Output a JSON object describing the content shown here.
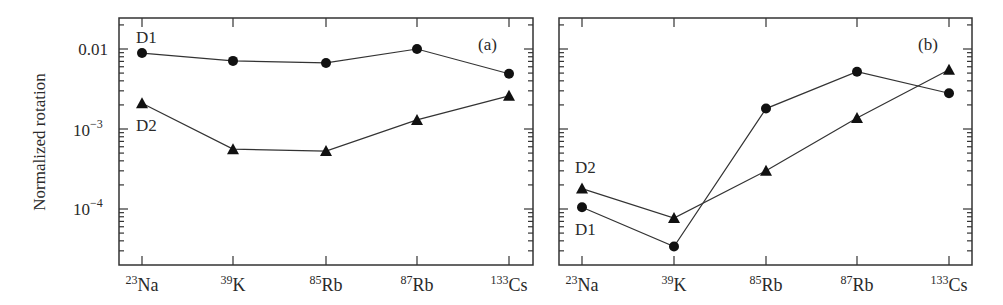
{
  "figure": {
    "ylabel": "Normalized rotation",
    "ytick_labels": [
      "0.01",
      "10",
      "-3",
      "10",
      "-4"
    ],
    "xtick_labels": [
      {
        "mass": "23",
        "el": "Na"
      },
      {
        "mass": "39",
        "el": "K"
      },
      {
        "mass": "85",
        "el": "Rb"
      },
      {
        "mass": "87",
        "el": "Rb"
      },
      {
        "mass": "133",
        "el": "Cs"
      }
    ],
    "panel_a": {
      "label": "(a)",
      "d1_label": "D1",
      "d2_label": "D2"
    },
    "panel_b": {
      "label": "(b)",
      "d1_label": "D1",
      "d2_label": "D2"
    }
  },
  "chart_data": [
    {
      "type": "line",
      "title": "(a)",
      "xlabel": "",
      "ylabel": "Normalized rotation",
      "yscale": "log",
      "ylim": [
        2.3e-05,
        0.025
      ],
      "categories": [
        "23Na",
        "39K",
        "85Rb",
        "87Rb",
        "133Cs"
      ],
      "series": [
        {
          "name": "D1",
          "marker": "circle",
          "values": [
            0.0089,
            0.0071,
            0.0067,
            0.01,
            0.0049
          ]
        },
        {
          "name": "D2",
          "marker": "triangle",
          "values": [
            0.0021,
            0.00056,
            0.00053,
            0.0013,
            0.0026
          ]
        }
      ],
      "grid": false
    },
    {
      "type": "line",
      "title": "(b)",
      "xlabel": "",
      "ylabel": "Normalized rotation",
      "yscale": "log",
      "ylim": [
        2.3e-05,
        0.025
      ],
      "categories": [
        "23Na",
        "39K",
        "85Rb",
        "87Rb",
        "133Cs"
      ],
      "series": [
        {
          "name": "D1",
          "marker": "circle",
          "values": [
            0.000105,
            3.4e-05,
            0.0018,
            0.0052,
            0.0028
          ]
        },
        {
          "name": "D2",
          "marker": "triangle",
          "values": [
            0.00018,
            7.7e-05,
            0.0003,
            0.00137,
            0.0055
          ]
        }
      ],
      "grid": false
    }
  ]
}
